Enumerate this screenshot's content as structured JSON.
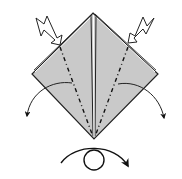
{
  "diagram": {
    "type": "origami-step",
    "colors": {
      "paper": "#c8c8c8",
      "outline": "#1a1a1a",
      "background": "#ffffff"
    },
    "symbols": [
      {
        "name": "push-arrow-left",
        "meaning": "push in"
      },
      {
        "name": "push-arrow-right",
        "meaning": "push in"
      },
      {
        "name": "fold-arrow-left",
        "meaning": "fold outward"
      },
      {
        "name": "fold-arrow-right",
        "meaning": "fold outward"
      },
      {
        "name": "turn-over-symbol",
        "meaning": "turn model over"
      }
    ]
  }
}
